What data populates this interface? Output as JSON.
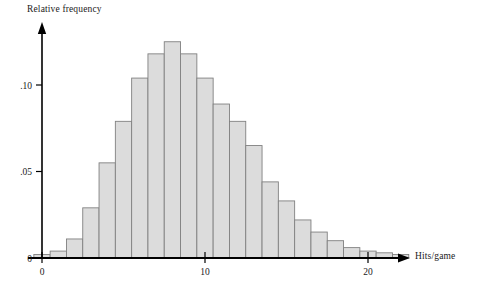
{
  "chart_data": {
    "type": "bar",
    "title": "",
    "subtitle": "",
    "xlabel": "Hits/game",
    "ylabel": "Relative frequency",
    "grid": false,
    "legend": false,
    "xlim": [
      -0.5,
      22.5
    ],
    "ylim": [
      0,
      0.135
    ],
    "xticks": [
      0,
      10,
      20
    ],
    "xtick_labels": [
      "0",
      "10",
      "20"
    ],
    "yticks": [
      0,
      0.05,
      0.1
    ],
    "ytick_labels": [
      "0",
      ".05",
      ".10"
    ],
    "categories": [
      0,
      1,
      2,
      3,
      4,
      5,
      6,
      7,
      8,
      9,
      10,
      11,
      12,
      13,
      14,
      15,
      16,
      17,
      18,
      19,
      20,
      21,
      22
    ],
    "values": [
      0.002,
      0.004,
      0.011,
      0.029,
      0.055,
      0.079,
      0.104,
      0.118,
      0.125,
      0.118,
      0.104,
      0.089,
      0.079,
      0.065,
      0.044,
      0.033,
      0.022,
      0.015,
      0.01,
      0.006,
      0.004,
      0.003,
      0.002
    ],
    "bar_fill": "#dcdcdc",
    "bar_stroke": "#808080",
    "axis_color": "#000000"
  },
  "axes": {
    "y_title": "Relative frequency",
    "x_title": "Hits/game"
  }
}
